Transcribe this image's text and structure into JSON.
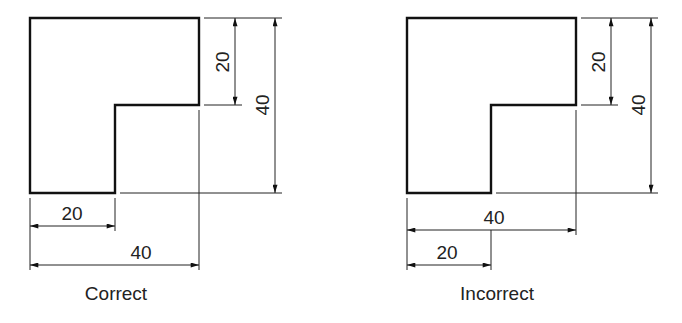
{
  "figures": [
    {
      "caption": "Correct",
      "dims": {
        "vertical_small": "20",
        "vertical_large": "40",
        "horizontal_small": "20",
        "horizontal_large": "40"
      }
    },
    {
      "caption": "Incorrect",
      "dims": {
        "vertical_small": "20",
        "vertical_large": "40",
        "horizontal_large": "40",
        "horizontal_small": "20"
      }
    }
  ],
  "colors": {
    "line": "#111111",
    "background": "#ffffff"
  }
}
